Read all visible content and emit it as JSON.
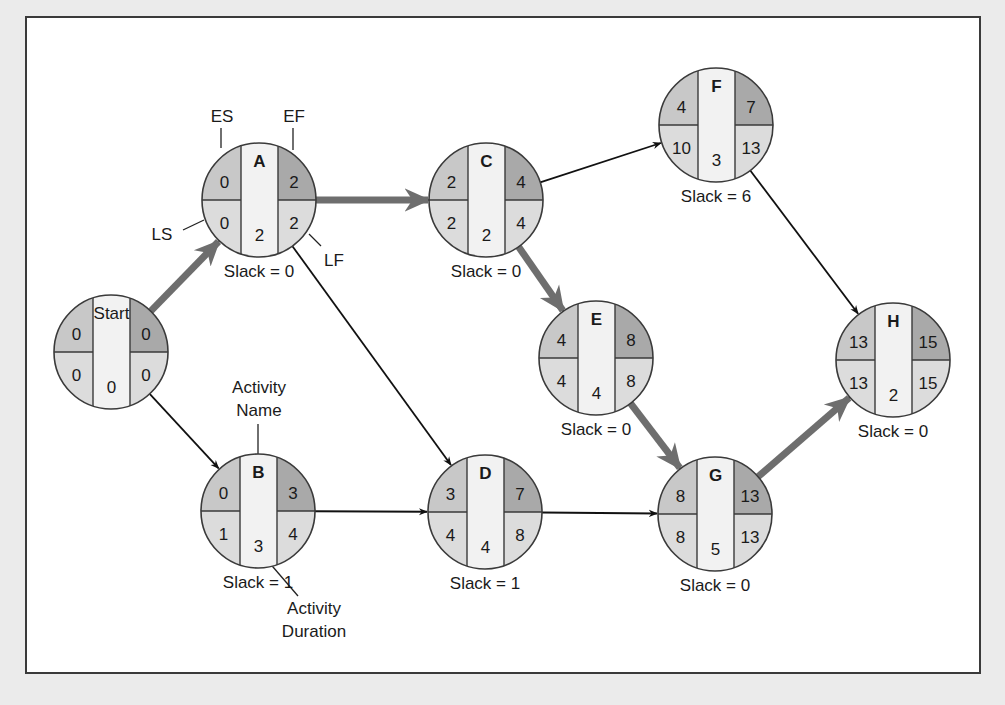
{
  "diagram": {
    "type": "AON network with ES/EF/LS/LF (critical path method)",
    "legend_labels": {
      "es": "ES",
      "ef": "EF",
      "ls": "LS",
      "lf": "LF",
      "activity_name": "Activity\nName",
      "activity_name_line1": "Activity",
      "activity_name_line2": "Name",
      "activity_duration_line1": "Activity",
      "activity_duration_line2": "Duration"
    },
    "nodes": [
      {
        "id": "Start",
        "name": "Start",
        "es": "0",
        "ef": "0",
        "ls": "0",
        "lf": "0",
        "duration": "0",
        "slack": "",
        "cx": 111,
        "cy": 352
      },
      {
        "id": "A",
        "name": "A",
        "es": "0",
        "ef": "2",
        "ls": "0",
        "lf": "2",
        "duration": "2",
        "slack": "Slack = 0",
        "cx": 259,
        "cy": 200
      },
      {
        "id": "B",
        "name": "B",
        "es": "0",
        "ef": "3",
        "ls": "1",
        "lf": "4",
        "duration": "3",
        "slack": "Slack = 1",
        "cx": 258,
        "cy": 511
      },
      {
        "id": "C",
        "name": "C",
        "es": "2",
        "ef": "4",
        "ls": "2",
        "lf": "4",
        "duration": "2",
        "slack": "Slack = 0",
        "cx": 486,
        "cy": 200
      },
      {
        "id": "D",
        "name": "D",
        "es": "3",
        "ef": "7",
        "ls": "4",
        "lf": "8",
        "duration": "4",
        "slack": "Slack = 1",
        "cx": 485,
        "cy": 512
      },
      {
        "id": "E",
        "name": "E",
        "es": "4",
        "ef": "8",
        "ls": "4",
        "lf": "8",
        "duration": "4",
        "slack": "Slack = 0",
        "cx": 596,
        "cy": 358
      },
      {
        "id": "F",
        "name": "F",
        "es": "4",
        "ef": "7",
        "ls": "10",
        "lf": "13",
        "duration": "3",
        "slack": "Slack = 6",
        "cx": 716,
        "cy": 125
      },
      {
        "id": "G",
        "name": "G",
        "es": "8",
        "ef": "13",
        "ls": "8",
        "lf": "13",
        "duration": "5",
        "slack": "Slack = 0",
        "cx": 715,
        "cy": 514
      },
      {
        "id": "H",
        "name": "H",
        "es": "13",
        "ef": "15",
        "ls": "13",
        "lf": "15",
        "duration": "2",
        "slack": "Slack = 0",
        "cx": 893,
        "cy": 360
      }
    ],
    "edges": [
      {
        "from": "Start",
        "to": "A",
        "critical": true
      },
      {
        "from": "Start",
        "to": "B",
        "critical": false
      },
      {
        "from": "A",
        "to": "C",
        "critical": true
      },
      {
        "from": "A",
        "to": "D",
        "critical": false
      },
      {
        "from": "B",
        "to": "D",
        "critical": false
      },
      {
        "from": "C",
        "to": "F",
        "critical": false
      },
      {
        "from": "C",
        "to": "E",
        "critical": true
      },
      {
        "from": "E",
        "to": "G",
        "critical": true
      },
      {
        "from": "D",
        "to": "G",
        "critical": false
      },
      {
        "from": "F",
        "to": "H",
        "critical": false
      },
      {
        "from": "G",
        "to": "H",
        "critical": true
      }
    ],
    "colors": {
      "page_bg": "#ebebeb",
      "frame_bg": "#ffffff",
      "es_ef_fill_left": "#c8c8c8",
      "ef_fill": "#a9a9a9",
      "ls_lf_fill": "#dcdcdc",
      "center_fill": "#f2f2f2",
      "critical_arrow": "#6e6e6e",
      "normal_arrow": "#111111",
      "outline": "#3a3a3a"
    }
  }
}
